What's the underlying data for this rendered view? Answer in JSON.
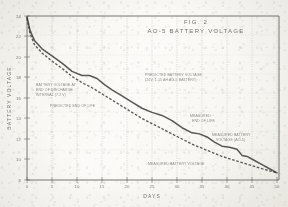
{
  "figure": {
    "title_line1": "FIG. 2",
    "title_line2": "AO-5 BATTERY VOLTAGE",
    "background_color": "#fbfaf7",
    "ink_color": "#2f2e2b"
  },
  "chart_data": {
    "type": "line",
    "title": "AO-5 BATTERY VOLTAGE",
    "subtitle": "FIG. 2",
    "xlabel": "DAYS",
    "ylabel": "BATTERY VOLTAGE",
    "xlim": [
      0,
      50
    ],
    "ylim": [
      8,
      24
    ],
    "xticks": [
      0,
      5,
      10,
      15,
      20,
      25,
      30,
      35,
      40,
      45,
      50
    ],
    "xticklabels": [
      "0",
      "5",
      "10",
      "15",
      "20",
      "25",
      "30",
      "35",
      "40",
      "45",
      "50"
    ],
    "yticks": [
      8,
      10,
      12,
      14,
      16,
      18,
      20,
      22,
      24
    ],
    "yticklabels": [
      "8",
      "10",
      "12",
      "14",
      "16",
      "18",
      "20",
      "22",
      "24"
    ],
    "grid": "vertical",
    "legend_position": "none",
    "series": [
      {
        "name": "PREDICTED BATTERY VOLTAGE",
        "style": "solid",
        "x": [
          0,
          0.6,
          1.5,
          3,
          5,
          7,
          9,
          11,
          12.5,
          14,
          15.5,
          17,
          19,
          21,
          23,
          25,
          27,
          29,
          31,
          33,
          34.5,
          36,
          37.5,
          39,
          40.5,
          42,
          43,
          44,
          45.5,
          47,
          48.5,
          50
        ],
        "y": [
          23.9,
          22.6,
          21.6,
          20.8,
          20.1,
          19.4,
          18.6,
          18.2,
          18.2,
          17.9,
          17.3,
          16.8,
          16.2,
          15.6,
          15.0,
          14.6,
          14.3,
          13.8,
          13.1,
          12.6,
          12.5,
          12.2,
          11.7,
          11.3,
          11.2,
          11.0,
          10.4,
          10.3,
          9.9,
          9.5,
          9.1,
          8.7
        ]
      },
      {
        "name": "MEASURED BATTERY VOLTAGE",
        "style": "dashed",
        "x": [
          0,
          0.6,
          1.5,
          3,
          5,
          7,
          9,
          11,
          13,
          15,
          17,
          19,
          21,
          23,
          25,
          27,
          29,
          31,
          33,
          35,
          37,
          39,
          41,
          43,
          45,
          47,
          48.5,
          50
        ],
        "y": [
          23.8,
          22.3,
          21.2,
          20.4,
          19.6,
          18.9,
          18.1,
          17.5,
          17.0,
          16.4,
          15.8,
          15.2,
          14.6,
          14.0,
          13.5,
          13.0,
          12.5,
          12.0,
          11.5,
          11.1,
          10.7,
          10.3,
          10.0,
          9.7,
          9.4,
          9.1,
          8.9,
          8.7
        ]
      }
    ],
    "annotations": [
      {
        "id": "annot-upper-right",
        "text_lines": [
          "PREDICTED BATTERY VOLTAGE",
          "(24V, 1.15 AH AG-5 BATTERY)"
        ],
        "x": 22,
        "y": 16.6
      },
      {
        "id": "annot-upper-left",
        "text_lines": [
          "BATTERY VOLTAGE AT",
          "END OF DISCHARGE",
          "INTERVAL (7.2 V)"
        ],
        "x": 4,
        "y": 14.2
      },
      {
        "id": "annot-left-lower",
        "text_lines": [
          "PREDICTED END OF LIFE"
        ],
        "x": 7,
        "y": 12.3
      },
      {
        "id": "annot-right-mid",
        "text_lines": [
          "MEASURED",
          "END OF LIFE"
        ],
        "x": 34,
        "y": 13.0
      },
      {
        "id": "annot-right-low",
        "text_lines": [
          "MEASURED BATTERY",
          "VOLTAGE (AO-5)"
        ],
        "x": 38,
        "y": 11.2
      },
      {
        "id": "annot-bottom",
        "text_lines": [
          "MEASURED BATTERY VOLTAGE"
        ],
        "x": 26,
        "y": 9.1
      }
    ]
  }
}
